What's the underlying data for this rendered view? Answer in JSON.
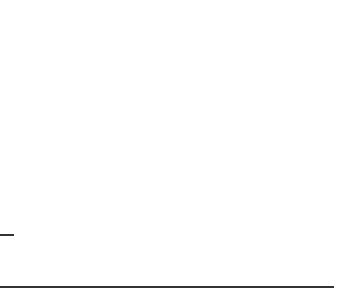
{
  "diagram": {
    "type": "base-ten-blocks",
    "colors": {
      "stroke": "#222222",
      "background": "#ffffff",
      "line": "#333333"
    },
    "groups": [
      {
        "name": "top",
        "tens": 6,
        "ones": 1,
        "value": 61
      },
      {
        "name": "bottom",
        "tens": 2,
        "ones": 9,
        "value": 29
      }
    ],
    "lines": [
      {
        "name": "answer-blank",
        "x1": 0,
        "x2": 13,
        "y": 235
      },
      {
        "name": "separator",
        "x1": 0,
        "x2": 333,
        "y": 287
      }
    ]
  }
}
